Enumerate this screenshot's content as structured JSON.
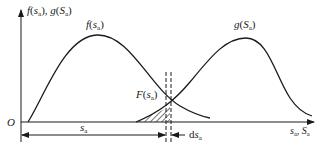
{
  "diagram": {
    "axes": {
      "origin_label": "O",
      "y_axis_label": {
        "f": "f",
        "s1": "s",
        "sub1": "a",
        "sep": ", ",
        "g": "g",
        "s2": "S",
        "sub2": "a"
      },
      "x_axis_label": {
        "s": "s",
        "sub1": "a",
        "sep": ", ",
        "S": "S",
        "sub2": "a"
      }
    },
    "curves": [
      {
        "name": "stress-density",
        "label_fn": "f",
        "label_var": "s",
        "label_sub": "a"
      },
      {
        "name": "strength-density",
        "label_fn": "g",
        "label_var": "S",
        "label_sub": "a"
      }
    ],
    "shaded_region": {
      "label_fn": "F",
      "label_var": "s",
      "label_sub": "a"
    },
    "dimensions": {
      "sa": {
        "var": "s",
        "sub": "a"
      },
      "dsa": {
        "prefix": "d",
        "var": "s",
        "sub": "a"
      }
    },
    "colors": {
      "stroke": "#1a1a1a",
      "background": "#ffffff"
    }
  }
}
